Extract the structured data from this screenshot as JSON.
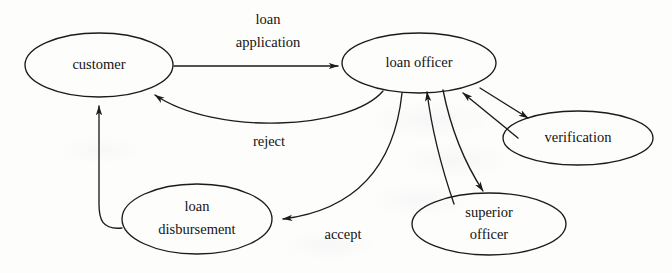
{
  "diagram": {
    "type": "directed-graph",
    "background_color": "#fdfdfc",
    "stroke_color": "#1b1b1b",
    "text_color": "#141414",
    "nodes": [
      {
        "id": "customer",
        "label": "customer",
        "label_line1": "customer",
        "label_line2": "",
        "cx": 99,
        "cy": 65,
        "rx": 74,
        "ry": 32
      },
      {
        "id": "loan-officer",
        "label": "loan officer",
        "label_line1": "loan officer",
        "label_line2": "",
        "cx": 419,
        "cy": 63,
        "rx": 77,
        "ry": 30
      },
      {
        "id": "verification",
        "label": "verification",
        "label_line1": "verification",
        "label_line2": "",
        "cx": 578,
        "cy": 138,
        "rx": 75,
        "ry": 27
      },
      {
        "id": "superior-officer",
        "label": "superior officer",
        "label_line1": "superior",
        "label_line2": "officer",
        "cx": 489,
        "cy": 224,
        "rx": 77,
        "ry": 31
      },
      {
        "id": "loan-disbursement",
        "label": "loan disbursement",
        "label_line1": "loan",
        "label_line2": "disbursement",
        "cx": 197,
        "cy": 219,
        "rx": 75,
        "ry": 35
      }
    ],
    "edges": [
      {
        "id": "customer-to-loan-officer",
        "from": "customer",
        "to": "loan-officer",
        "label_line1": "loan",
        "label_line2": "application",
        "label_x": 268,
        "label_y": 22,
        "directed": true,
        "bidirectional": false
      },
      {
        "id": "loan-officer-to-customer-reject",
        "from": "loan-officer",
        "to": "customer",
        "label_line1": "reject",
        "label_line2": "",
        "label_x": 269,
        "label_y": 143,
        "directed": true,
        "bidirectional": false
      },
      {
        "id": "loan-officer-to-disbursement",
        "from": "loan-officer",
        "to": "loan-disbursement",
        "label_line1": "accept",
        "label_line2": "",
        "label_x": 343,
        "label_y": 235,
        "directed": true,
        "bidirectional": false
      },
      {
        "id": "disbursement-to-customer",
        "from": "loan-disbursement",
        "to": "customer",
        "label_line1": "",
        "label_line2": "",
        "label_x": 0,
        "label_y": 0,
        "directed": true,
        "bidirectional": false
      },
      {
        "id": "loan-officer-verification",
        "from": "loan-officer",
        "to": "verification",
        "label_line1": "",
        "label_line2": "",
        "label_x": 0,
        "label_y": 0,
        "directed": true,
        "bidirectional": true
      },
      {
        "id": "loan-officer-superior-officer",
        "from": "loan-officer",
        "to": "superior-officer",
        "label_line1": "",
        "label_line2": "",
        "label_x": 0,
        "label_y": 0,
        "directed": true,
        "bidirectional": true
      }
    ]
  }
}
